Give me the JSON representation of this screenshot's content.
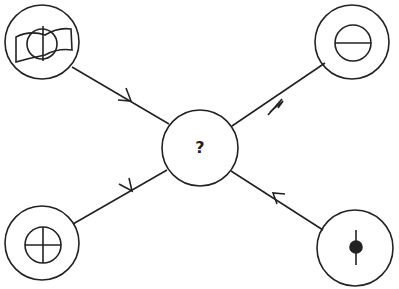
{
  "diagram": {
    "center": {
      "label": "?"
    },
    "nodes": [
      {
        "position": "top-left",
        "icon": "circle-over-wavy-rectangle-with-vertical-line"
      },
      {
        "position": "top-right",
        "icon": "circle-with-horizontal-line"
      },
      {
        "position": "bottom-left",
        "icon": "circle-with-cross"
      },
      {
        "position": "bottom-right",
        "icon": "filled-dot-with-vertical-line"
      }
    ],
    "edges": [
      {
        "from": "top-left",
        "to": "center"
      },
      {
        "from": "top-right",
        "to": "center"
      },
      {
        "from": "bottom-left",
        "to": "center"
      },
      {
        "from": "bottom-right",
        "to": "center"
      }
    ],
    "stroke_color": "#222222"
  }
}
